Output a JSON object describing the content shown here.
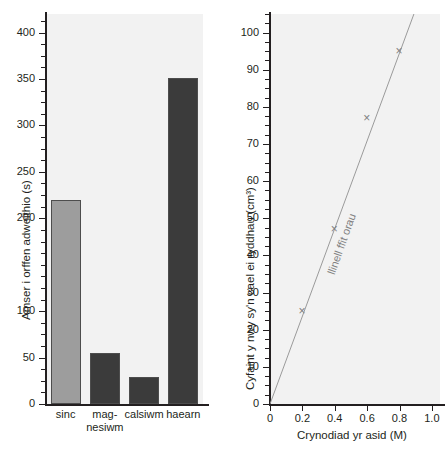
{
  "chart_data": [
    {
      "type": "bar",
      "id": "left",
      "title": "",
      "xlabel": "",
      "ylabel": "Amser i orffen adweithio (s)",
      "categories": [
        "sinc",
        "mag-\nnesiwm",
        "calsiwm",
        "haearn"
      ],
      "category_lines": [
        [
          "sinc"
        ],
        [
          "mag-",
          "nesiwm"
        ],
        [
          "calsiwm"
        ],
        [
          "haearn"
        ]
      ],
      "values": [
        220,
        55,
        29,
        351
      ],
      "ylim": [
        0,
        420
      ],
      "ytick_labels": [
        "0",
        "50",
        "100",
        "200",
        "250",
        "300",
        "350",
        "400"
      ],
      "ytick_values": [
        0,
        50,
        100,
        200,
        250,
        300,
        350,
        400
      ],
      "yminor_step": 12.5,
      "grid": false,
      "legend": "none",
      "bar_colors": [
        "#9d9d9d",
        "#3b3b3b",
        "#3b3b3b",
        "#3b3b3b"
      ]
    },
    {
      "type": "scatter",
      "id": "right",
      "title": "",
      "xlabel": "Crynodiad yr asid (M)",
      "ylabel": "Cyfaint y nwy sy'n cael ei ryddhau (cm³)",
      "x": [
        0.2,
        0.4,
        0.6,
        0.8
      ],
      "y": [
        25,
        47,
        77,
        95
      ],
      "xlim": [
        0,
        1.05
      ],
      "ylim": [
        0,
        105
      ],
      "xtick_labels": [
        "0",
        "0.2",
        "0.4",
        "0.6",
        "0.8",
        "1.0"
      ],
      "xtick_values": [
        0,
        0.2,
        0.4,
        0.6,
        0.8,
        1.0
      ],
      "ytick_labels": [
        "0",
        "10",
        "20",
        "30",
        "40",
        "50",
        "60",
        "70",
        "80",
        "90",
        "100"
      ],
      "ytick_values": [
        0,
        10,
        20,
        30,
        40,
        50,
        60,
        70,
        80,
        90,
        100
      ],
      "yminor_step": 2.5,
      "annotation": "llinell ffit orau",
      "marker_symbol": "×",
      "marker_color": "#808080",
      "line_color": "#9a9a9a",
      "grid": false,
      "legend": "none"
    }
  ],
  "caption": {
    "text": ""
  }
}
